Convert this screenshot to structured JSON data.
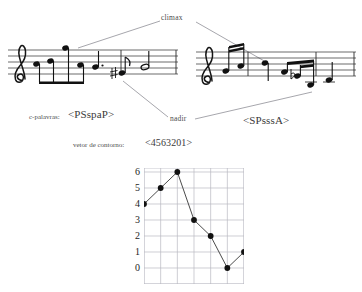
{
  "figure": {
    "annotations": {
      "climax": "climax",
      "nadir": "nadir"
    },
    "contour_word_label": "c-palavras:",
    "contour_word_left": "<PSspaP>",
    "contour_word_right": "<SPsssA>",
    "contour_vector_label": "vetor de contorno:",
    "contour_vector_value": "<4563201>"
  },
  "chart_data": {
    "type": "line",
    "title": "",
    "xlabel": "",
    "ylabel": "",
    "x": [
      0,
      1,
      2,
      3,
      4,
      5,
      6
    ],
    "values": [
      4,
      5,
      6,
      3,
      2,
      0,
      1
    ],
    "categories": [
      "1",
      "2",
      "3",
      "4",
      "5",
      "6",
      "7"
    ],
    "ytick_labels": [
      "6",
      "5",
      "4",
      "3",
      "2",
      "1",
      "0"
    ],
    "ylim": [
      0,
      6
    ],
    "xlim": [
      0,
      6
    ],
    "grid": true,
    "legend": "none",
    "marker": "filled-circle",
    "line_color": "#4b4b4b",
    "marker_color": "#111111",
    "grid_color": "#b9b9c2"
  },
  "colors": {
    "background": "#ffffff",
    "ink": "#1d1d1d",
    "leader_line": "#8f8f97"
  },
  "music": {
    "left_staff": {
      "clef": "treble-clef",
      "notes": [
        "eighth",
        "eighth",
        "eighth",
        "eighth",
        "quarter-dotted",
        "sharp-eighth",
        "eighth-rest",
        "half"
      ]
    },
    "right_staff": {
      "clef": "treble-clef",
      "notes": [
        "sixteenth",
        "sixteenth",
        "quarter",
        "sixteenth",
        "flat-sixteenth",
        "sixteenth",
        "eighth"
      ]
    }
  }
}
